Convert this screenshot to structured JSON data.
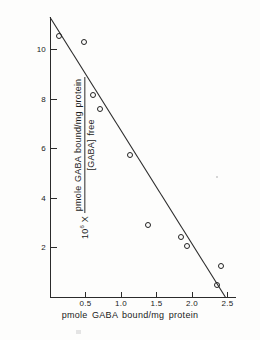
{
  "chart_data": {
    "type": "scatter",
    "title": "",
    "subtitle": "",
    "xlabel": "pmole GABA bound/mg  protein",
    "ylabel_prefix": "10",
    "ylabel_prefix_exponent": "6",
    "ylabel_prefix_operator": "X",
    "ylabel_numerator": "pmole GABA bound/mg  protein",
    "ylabel_denominator": "[GABA] free",
    "xlim": [
      0,
      2.62
    ],
    "ylim": [
      0,
      11.35
    ],
    "xticks": [
      0.5,
      1.0,
      1.5,
      2.0,
      2.5
    ],
    "xtick_labels": [
      "0.5",
      "1.0",
      "1.5",
      "2.0",
      "2.5"
    ],
    "yticks": [
      2,
      4,
      6,
      8,
      10
    ],
    "ytick_labels": [
      "2",
      "4",
      "6",
      "8",
      "10"
    ],
    "grid": false,
    "legend": false,
    "marker": "open-circle",
    "points": [
      {
        "x": 0.13,
        "y": 10.55
      },
      {
        "x": 0.48,
        "y": 10.3
      },
      {
        "x": 0.6,
        "y": 8.15
      },
      {
        "x": 0.7,
        "y": 7.6
      },
      {
        "x": 1.12,
        "y": 5.72
      },
      {
        "x": 1.38,
        "y": 2.9
      },
      {
        "x": 1.85,
        "y": 2.42
      },
      {
        "x": 1.93,
        "y": 2.07
      },
      {
        "x": 2.41,
        "y": 1.27
      },
      {
        "x": 2.35,
        "y": 0.48
      }
    ],
    "fit_line": {
      "type": "linear-regression",
      "x_start": 0.0,
      "y_start": 11.3,
      "x_end": 2.47,
      "y_end": 0.0
    }
  },
  "axes": {
    "x_axis_name": "x-axis",
    "y_axis_name": "y-axis"
  }
}
